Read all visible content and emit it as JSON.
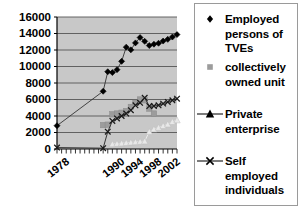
{
  "chart_data": {
    "type": "line",
    "title": "",
    "xlabel": "",
    "ylabel": "",
    "ylim": [
      0,
      16000
    ],
    "ytick_step": 2000,
    "yticks": [
      "16000",
      "14000",
      "12000",
      "10000",
      "8000",
      "6000",
      "4000",
      "2000",
      "0"
    ],
    "xticks": [
      "1978",
      "1990",
      "1994",
      "1998",
      "2002"
    ],
    "xtick_years": [
      1978,
      1990,
      1994,
      1998,
      2002
    ],
    "x_range": [
      1978,
      2004
    ],
    "grid": "horizontal",
    "legend_position": "right",
    "plot_background": "#c8c8c8",
    "series": [
      {
        "name": "Employed persons of TVEs",
        "marker": "diamond",
        "color": "#000000",
        "x": [
          1978,
          1988,
          1989,
          1990,
          1991,
          1992,
          1993,
          1994,
          1995,
          1996,
          1997,
          1998,
          1999,
          2000,
          2001,
          2002,
          2003,
          2004
        ],
        "values": [
          2827,
          7000,
          9367,
          9265,
          9614,
          10625,
          12345,
          12017,
          12862,
          13508,
          13050,
          12537,
          12704,
          12820,
          13086,
          13288,
          13573,
          13866
        ]
      },
      {
        "name": "collectively owned unit",
        "marker": "square",
        "color": "#9c9c9c",
        "x": [
          1988,
          1989,
          1990,
          1991,
          1992,
          1993,
          1994,
          1995,
          1996,
          1997,
          1998,
          1999
        ],
        "values": [
          2900,
          2950,
          4200,
          4300,
          4400,
          4600,
          5100,
          5600,
          6000,
          5900,
          4900,
          4300
        ]
      },
      {
        "name": "Private enterprise",
        "marker": "triangle",
        "color": "#e8e8e8",
        "x": [
          1990,
          1991,
          1992,
          1993,
          1994,
          1995,
          1996,
          1997,
          1998,
          1999,
          2000,
          2001,
          2002,
          2003,
          2004
        ],
        "values": [
          600,
          650,
          700,
          750,
          800,
          850,
          900,
          950,
          2100,
          2400,
          2600,
          2800,
          3000,
          3300,
          3500
        ]
      },
      {
        "name": "Self employed individuals",
        "marker": "cross",
        "color": "#1a1a1a",
        "x": [
          1978,
          1988,
          1989,
          1990,
          1991,
          1992,
          1993,
          1994,
          1995,
          1996,
          1997,
          1998,
          1999,
          2000,
          2001,
          2002,
          2003,
          2004
        ],
        "values": [
          170,
          100,
          2100,
          3400,
          3700,
          4000,
          4300,
          4700,
          5300,
          5600,
          6200,
          5200,
          5200,
          5300,
          5500,
          5700,
          5900,
          6100
        ]
      }
    ]
  },
  "legend": {
    "entries": [
      {
        "label": "Employed\npersons of\nTVEs",
        "marker": "diamond"
      },
      {
        "label": "collectively\nowned unit",
        "marker": "square"
      },
      {
        "label": "Private\nenterprise",
        "marker": "triangle"
      },
      {
        "label": "Self\nemployed\nindividuals",
        "marker": "cross"
      }
    ]
  },
  "colors": {
    "plot_bg": "#c8c8c8",
    "gridline": "#555555",
    "axis": "#000000",
    "series_diamond": "#000000",
    "series_square": "#9c9c9c",
    "series_triangle": "#ededed",
    "series_cross": "#1a1a1a",
    "legend_border": "#9a9a9a"
  }
}
